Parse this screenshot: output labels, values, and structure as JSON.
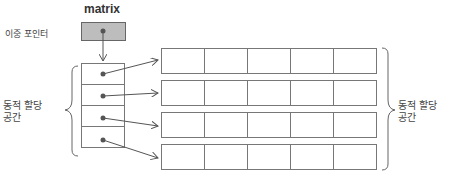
{
  "diagram": {
    "pointer": {
      "name": "matrix",
      "label": "이중 포인터"
    },
    "pointer_array": {
      "cells": 4,
      "label_line1": "동적 할당",
      "label_line2": "공간"
    },
    "row_arrays": {
      "rows": 4,
      "columns": 5,
      "label_line1": "동적 할당",
      "label_line2": "공간"
    },
    "colors": {
      "pointer_fill": "#bdbdbd",
      "line": "#666666",
      "dot": "#555555"
    }
  }
}
